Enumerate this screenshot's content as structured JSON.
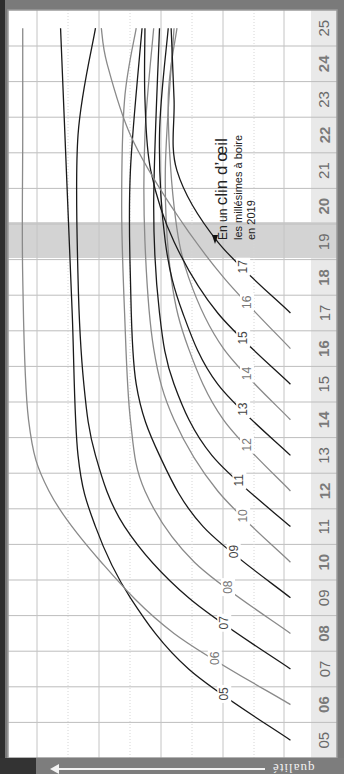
{
  "chart_data": {
    "type": "line",
    "orientation": "rotated-90",
    "subtitle": "les millésimes à boire en 2019",
    "highlight_year": "19",
    "x_axis_ticks": [
      "05",
      "06",
      "07",
      "08",
      "09",
      "10",
      "11",
      "12",
      "13",
      "14",
      "15",
      "16",
      "17",
      "18",
      "19",
      "20",
      "21",
      "22",
      "23",
      "24",
      "25"
    ],
    "y_axis_label": "qualité",
    "grid": true,
    "series": [
      {
        "name": "05",
        "color": "#1a1a1a",
        "x": [
          "05",
          "07",
          "09",
          "11",
          "13",
          "17",
          "21",
          "25"
        ],
        "values": [
          0.05,
          0.4,
          0.6,
          0.72,
          0.78,
          0.8,
          0.82,
          0.84
        ]
      },
      {
        "name": "06",
        "color": "#8a8a8a",
        "x": [
          "06",
          "08",
          "10",
          "12",
          "14",
          "18",
          "22",
          "25"
        ],
        "values": [
          0.05,
          0.45,
          0.7,
          0.88,
          0.95,
          0.97,
          0.97,
          0.97
        ]
      },
      {
        "name": "07",
        "color": "#1a1a1a",
        "x": [
          "07",
          "09",
          "11",
          "13",
          "15",
          "18",
          "22",
          "25"
        ],
        "values": [
          0.05,
          0.4,
          0.62,
          0.72,
          0.76,
          0.78,
          0.78,
          0.72
        ]
      },
      {
        "name": "08",
        "color": "#8a8a8a",
        "x": [
          "08",
          "10",
          "12",
          "14",
          "17",
          "20",
          "23",
          "25"
        ],
        "values": [
          0.05,
          0.38,
          0.55,
          0.6,
          0.62,
          0.63,
          0.62,
          0.58
        ]
      },
      {
        "name": "09",
        "color": "#1a1a1a",
        "x": [
          "09",
          "11",
          "13",
          "15",
          "18",
          "21",
          "25"
        ],
        "values": [
          0.05,
          0.35,
          0.5,
          0.58,
          0.6,
          0.6,
          0.56
        ]
      },
      {
        "name": "10",
        "color": "#8a8a8a",
        "x": [
          "10",
          "12",
          "14",
          "16",
          "19",
          "22",
          "25"
        ],
        "values": [
          0.05,
          0.3,
          0.45,
          0.52,
          0.55,
          0.55,
          0.52
        ]
      },
      {
        "name": "11",
        "color": "#1a1a1a",
        "x": [
          "11",
          "13",
          "15",
          "17",
          "20",
          "25"
        ],
        "values": [
          0.05,
          0.32,
          0.45,
          0.5,
          0.52,
          0.5
        ]
      },
      {
        "name": "12",
        "color": "#8a8a8a",
        "x": [
          "12",
          "14",
          "16",
          "18",
          "21",
          "25"
        ],
        "values": [
          0.05,
          0.28,
          0.4,
          0.46,
          0.48,
          0.45
        ]
      },
      {
        "name": "13",
        "color": "#1a1a1a",
        "x": [
          "13",
          "15",
          "17",
          "19",
          "22",
          "25"
        ],
        "values": [
          0.05,
          0.3,
          0.42,
          0.48,
          0.5,
          0.47
        ]
      },
      {
        "name": "14",
        "color": "#8a8a8a",
        "x": [
          "14",
          "16",
          "18",
          "20",
          "23",
          "25"
        ],
        "values": [
          0.05,
          0.28,
          0.4,
          0.45,
          0.47,
          0.44
        ]
      },
      {
        "name": "15",
        "color": "#1a1a1a",
        "x": [
          "15",
          "17",
          "19",
          "21",
          "23",
          "25"
        ],
        "values": [
          0.05,
          0.3,
          0.45,
          0.53,
          0.55,
          0.55
        ]
      },
      {
        "name": "16",
        "color": "#8a8a8a",
        "x": [
          "16",
          "18",
          "20",
          "22",
          "24",
          "25"
        ],
        "values": [
          0.05,
          0.28,
          0.46,
          0.6,
          0.68,
          0.7
        ]
      },
      {
        "name": "17",
        "color": "#1a1a1a",
        "x": [
          "17",
          "19",
          "21",
          "23",
          "25"
        ],
        "values": [
          0.05,
          0.3,
          0.44,
          0.45,
          0.46
        ]
      }
    ]
  },
  "annotation": {
    "prefix": "En un ",
    "emphasis": "clin d’œil",
    "line2": "les millésimes à boire",
    "line3": "en 2019"
  },
  "axis_label_bottom": "qualité",
  "colors": {
    "dark_line": "#1a1a1a",
    "gray_line": "#8a8a8a",
    "highlight": "#d4d4d4",
    "label_strip": "#e8e8e8",
    "grid": "#bdbdbd",
    "frame": "#7a7a7a"
  }
}
